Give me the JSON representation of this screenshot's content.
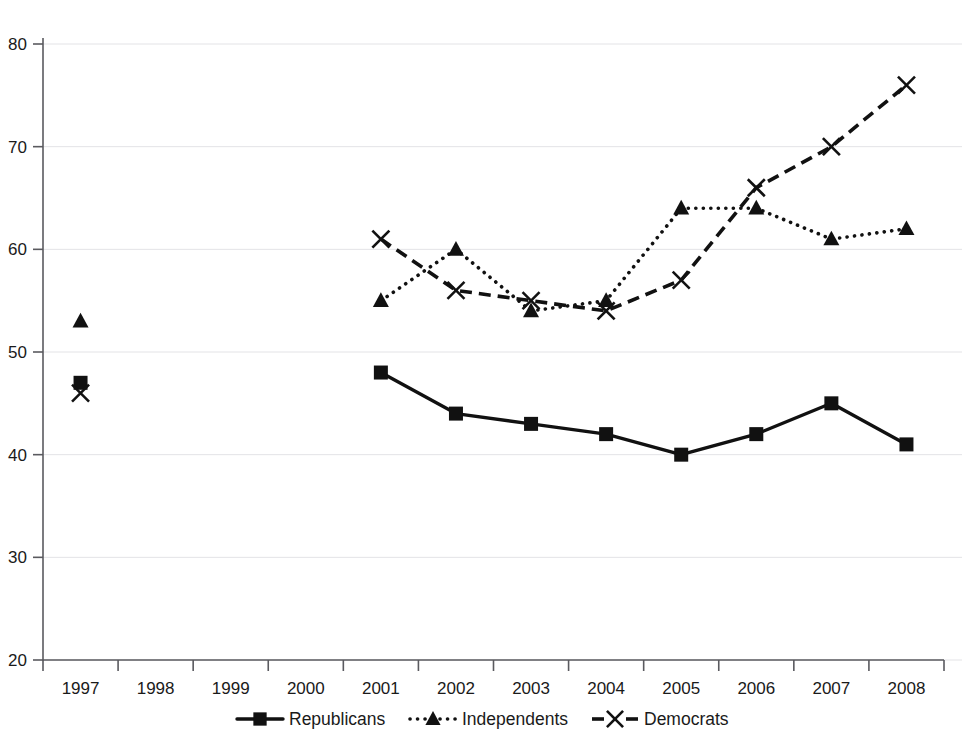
{
  "chart_data": {
    "type": "line",
    "title": "",
    "subtitle": "",
    "xlabel": "",
    "ylabel": "",
    "x": [
      "1997",
      "1998",
      "1999",
      "2000",
      "2001",
      "2002",
      "2003",
      "2004",
      "2005",
      "2006",
      "2007",
      "2008"
    ],
    "categories": [
      "1997",
      "1998",
      "1999",
      "2000",
      "2001",
      "2002",
      "2003",
      "2004",
      "2005",
      "2006",
      "2007",
      "2008"
    ],
    "ylim": [
      20,
      80
    ],
    "yticks": [
      20,
      30,
      40,
      50,
      60,
      70,
      80
    ],
    "ytick_labels": [
      "20",
      "30",
      "40",
      "50",
      "60",
      "70",
      "80"
    ],
    "xtick_labels": [
      "1997",
      "1998",
      "1999",
      "2000",
      "2001",
      "2002",
      "2003",
      "2004",
      "2005",
      "2006",
      "2007",
      "2008"
    ],
    "grid": true,
    "grid_axis": "y",
    "legend_position": "bottom",
    "series": [
      {
        "name": "Republicans",
        "marker": "square",
        "line_style": "solid",
        "color": "#111111",
        "values": [
          47,
          null,
          null,
          null,
          48,
          44,
          43,
          42,
          40,
          42,
          45,
          41
        ]
      },
      {
        "name": "Independents",
        "marker": "triangle",
        "line_style": "dotted",
        "color": "#111111",
        "values": [
          53,
          null,
          null,
          null,
          55,
          60,
          54,
          55,
          64,
          64,
          61,
          62
        ]
      },
      {
        "name": "Democrats",
        "marker": "x",
        "line_style": "dashed",
        "color": "#111111",
        "values": [
          46,
          null,
          null,
          null,
          61,
          56,
          55,
          54,
          57,
          66,
          70,
          76
        ]
      }
    ]
  },
  "legend": {
    "items": [
      {
        "label": "Republicans",
        "marker": "square",
        "line_style": "solid"
      },
      {
        "label": "Independents",
        "marker": "triangle",
        "line_style": "dotted"
      },
      {
        "label": "Democrats",
        "marker": "x",
        "line_style": "dashed"
      }
    ]
  },
  "colors": {
    "series": "#111111",
    "grid": "#e3e3e6",
    "axis": "#5a5a5f",
    "background": "#ffffff",
    "text": "#1a1a1a"
  }
}
